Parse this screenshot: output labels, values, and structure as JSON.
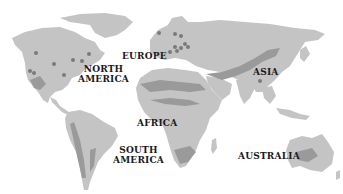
{
  "map": {
    "type": "world-continents",
    "colors": {
      "land": "#c4c4c4",
      "region_dark": "#9a9a9a",
      "marker": "#7a7a7a",
      "label": "#1a1a1a",
      "ocean": "#ffffff"
    },
    "labels": [
      {
        "id": "north-america",
        "text": "NORTH\nAMERICA",
        "x": 78,
        "y": 64
      },
      {
        "id": "europe",
        "text": "EUROPE",
        "x": 122,
        "y": 51
      },
      {
        "id": "asia",
        "text": "ASIA",
        "x": 253,
        "y": 67
      },
      {
        "id": "africa",
        "text": "AFRICA",
        "x": 137,
        "y": 118
      },
      {
        "id": "south-america",
        "text": "SOUTH\nAMERICA",
        "x": 113,
        "y": 145
      },
      {
        "id": "australia",
        "text": "AUSTRALIA",
        "x": 238,
        "y": 151
      }
    ],
    "markers": [
      [
        36,
        53
      ],
      [
        54,
        64
      ],
      [
        64,
        75
      ],
      [
        30,
        71
      ],
      [
        34,
        73
      ],
      [
        73,
        60
      ],
      [
        82,
        61
      ],
      [
        89,
        54
      ],
      [
        159,
        33
      ],
      [
        175,
        34
      ],
      [
        181,
        36
      ],
      [
        185,
        44
      ],
      [
        175,
        47
      ],
      [
        181,
        48
      ],
      [
        188,
        47
      ],
      [
        177,
        51
      ],
      [
        170,
        52
      ],
      [
        260,
        81
      ]
    ]
  }
}
